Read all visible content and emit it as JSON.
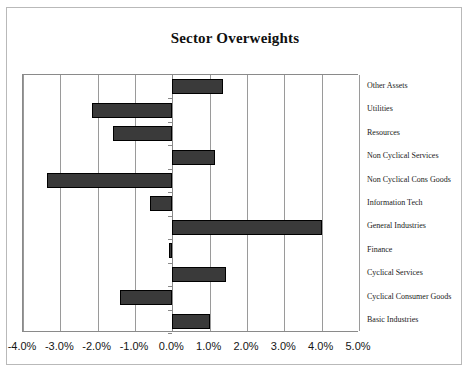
{
  "chart_data": {
    "type": "bar",
    "orientation": "horizontal",
    "title": "Sector Overweights",
    "xlabel": "",
    "ylabel": "",
    "xlim": [
      -4.0,
      5.0
    ],
    "xticks": [
      -4.0,
      -3.0,
      -2.0,
      -1.0,
      0.0,
      1.0,
      2.0,
      3.0,
      4.0,
      5.0
    ],
    "xtick_labels": [
      "-4.0%",
      "-3.0%",
      "-2.0%",
      "-1.0%",
      "0.0%",
      "1.0%",
      "2.0%",
      "3.0%",
      "4.0%",
      "5.0%"
    ],
    "grid": true,
    "legend": false,
    "category_label_position": "right",
    "bar_color": "#3a3a3a",
    "bar_edge_color": "#000000",
    "categories": [
      "Other Assets",
      "Utilities",
      "Resources",
      "Non Cyclical Services",
      "Non Cyclical Cons Goods",
      "Information Tech",
      "General Industries",
      "Finance",
      "Cyclical Services",
      "Cyclical Consumer Goods",
      "Basic Industries"
    ],
    "values": [
      1.35,
      -2.15,
      -1.6,
      1.15,
      -3.35,
      -0.6,
      4.0,
      -0.1,
      1.45,
      -1.4,
      1.0
    ],
    "unit": "%"
  }
}
